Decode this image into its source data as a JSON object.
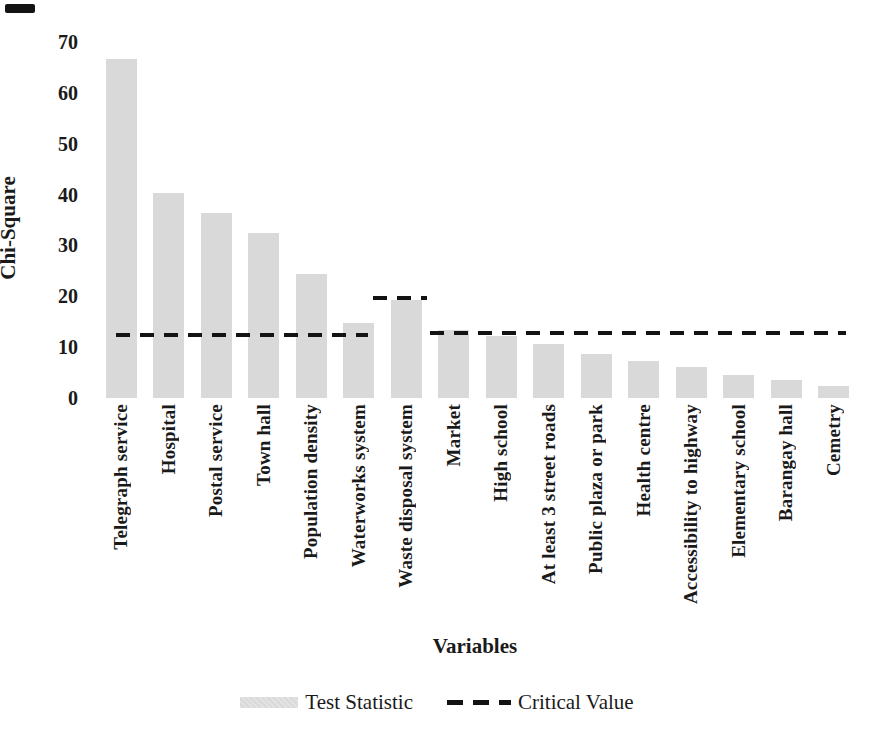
{
  "chart_data": {
    "type": "bar",
    "title": "",
    "xlabel": "Variables",
    "ylabel": "Chi-Square",
    "ylim": [
      0,
      70
    ],
    "yticks": [
      0,
      10,
      20,
      30,
      40,
      50,
      60,
      70
    ],
    "grid": false,
    "axis_lines": false,
    "legend_position": "bottom-center",
    "bar_color": "#d9d9d9",
    "line_color": "#131313",
    "categories": [
      "Telegraph service",
      "Hospital",
      "Postal service",
      "Town hall",
      "Population density",
      "Waterworks system",
      "Waste disposal system",
      "Market",
      "High school",
      "At least 3 street roads",
      "Public plaza or park",
      "Health centre",
      "Accessibility to highway",
      "Elementary school",
      "Barangay hall",
      "Cemetry"
    ],
    "series": [
      {
        "name": "Test Statistic",
        "type": "bar",
        "values": [
          66.6,
          40.3,
          36.4,
          32.4,
          24.4,
          14.7,
          19.2,
          13.3,
          12.2,
          10.6,
          8.7,
          7.3,
          6.1,
          4.5,
          3.5,
          2.4
        ]
      },
      {
        "name": "Critical Value",
        "type": "dashed-line-segments",
        "segments": [
          {
            "value": 12.3,
            "from_slot": -0.1,
            "to_slot": 5.2
          },
          {
            "value": 19.7,
            "from_slot": 5.3,
            "to_slot": 6.45
          },
          {
            "value": 12.8,
            "from_slot": 6.5,
            "to_slot": 15.26
          }
        ]
      }
    ],
    "legend": [
      {
        "label": "Test Statistic",
        "swatch": "bar-swatch"
      },
      {
        "label": "Critical Value",
        "swatch": "dashed-line-swatch"
      }
    ]
  }
}
